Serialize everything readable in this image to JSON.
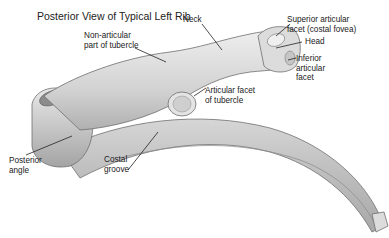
{
  "title": "Posterior View of Typical Left Rib",
  "labels": {
    "neck": "Neck",
    "superior_facet": "Superior articular\nfacet (costal fovea)",
    "head": "Head",
    "inferior_facet": "Inferior\narticular\nfacet",
    "non_articular": "Non-articular\npart of tubercle",
    "articular_facet_tubercle": "Articular facet\nof tubercle",
    "posterior_angle": "Posterior\nangle",
    "costal_groove": "Costal\ngroove"
  },
  "colors": {
    "bone_light": "#e4e4e4",
    "bone_mid": "#c8c8c8",
    "bone_dark": "#9a9a9a",
    "outline": "#6e6e6e",
    "leader": "#222222"
  }
}
